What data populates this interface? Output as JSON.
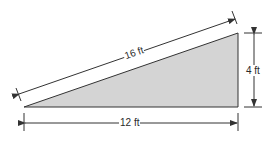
{
  "diagram": {
    "type": "right-triangle",
    "hypotenuse_label": "16 ft",
    "height_label": "4 ft",
    "base_label": "12 ft",
    "fill_color": "#d4d4d4",
    "stroke_color": "#333333"
  }
}
